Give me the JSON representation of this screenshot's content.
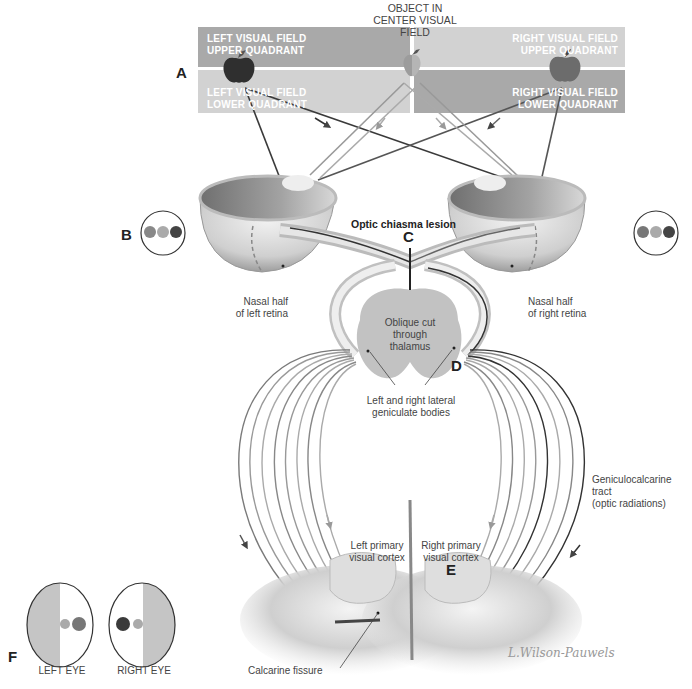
{
  "header": {
    "center_label_line1": "OBJECT IN",
    "center_label_line2": "CENTER VISUAL FIELD"
  },
  "visual_field": {
    "left_upper": {
      "line1": "LEFT VISUAL FIELD",
      "line2": "UPPER QUADRANT"
    },
    "left_lower": {
      "line1": "LEFT VISUAL FIELD",
      "line2": "LOWER QUADRANT"
    },
    "right_upper": {
      "line1": "RIGHT VISUAL FIELD",
      "line2": "UPPER QUADRANT"
    },
    "right_lower": {
      "line1": "RIGHT VISUAL FIELD",
      "line2": "LOWER QUADRANT"
    }
  },
  "markers": {
    "a": "A",
    "b": "B",
    "c": "C",
    "d": "D",
    "e": "E",
    "f": "F"
  },
  "labels": {
    "lesion": "Optic chiasma lesion",
    "nasal_left_1": "Nasal half",
    "nasal_left_2": "of left retina",
    "nasal_right_1": "Nasal half",
    "nasal_right_2": "of right retina",
    "thalamus_1": "Oblique cut",
    "thalamus_2": "through",
    "thalamus_3": "thalamus",
    "lgb_1": "Left and right lateral",
    "lgb_2": "geniculate bodies",
    "tract_1": "Geniculocalcarine",
    "tract_2": "tract",
    "tract_3": "(optic radiations)",
    "left_cortex_1": "Left primary",
    "left_cortex_2": "visual cortex",
    "right_cortex_1": "Right primary",
    "right_cortex_2": "visual cortex",
    "calcarine": "Calcarine fissure",
    "left_eye": "LEFT EYE",
    "right_eye": "RIGHT EYE",
    "signature": "L.Wilson-Pauwels"
  },
  "colors": {
    "quad_dark": "#a9a9a9",
    "quad_light": "#cfcfcf",
    "apple_dark": "#333333",
    "apple_mid": "#777777",
    "apple_light": "#a8a8a8",
    "fiber_dark": "#3a3a3a",
    "fiber_mid": "#7a7a7a",
    "fiber_light": "#aaaaaa",
    "thalamus": "#c2c2c2"
  }
}
